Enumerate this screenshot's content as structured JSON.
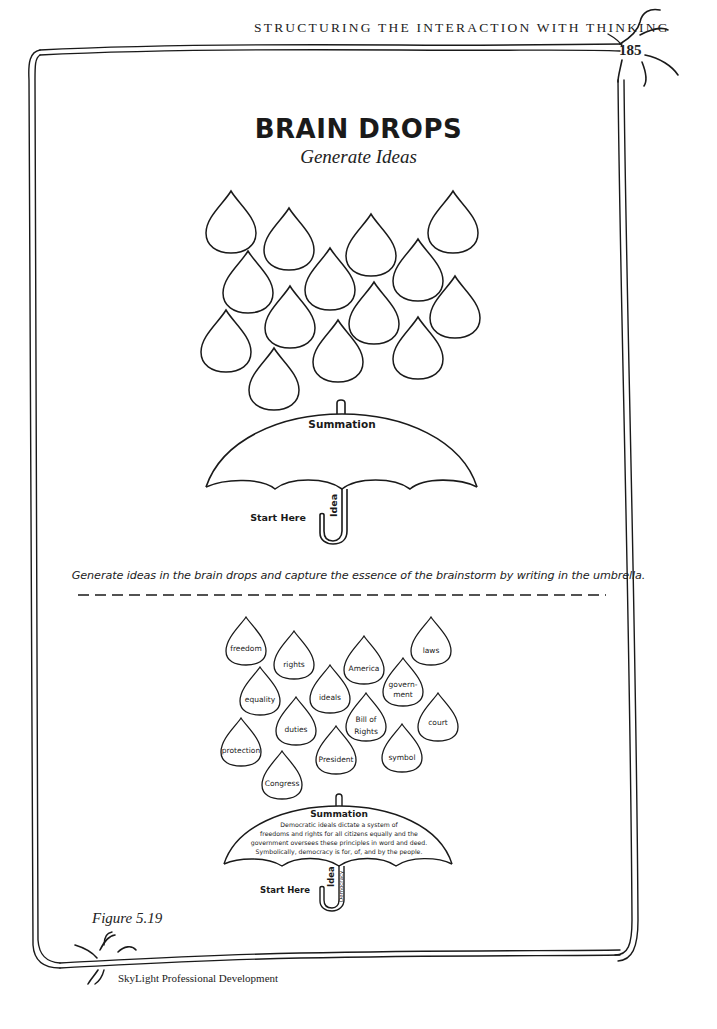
{
  "header": {
    "running_head": "STRUCTURING THE INTERACTION WITH THINKING",
    "page_number": "185"
  },
  "title": "BRAIN DROPS",
  "subtitle": "Generate Ideas",
  "blank_organizer": {
    "drop_count": 14,
    "umbrella": {
      "summation_label": "Summation",
      "idea_label": "Idea",
      "start_label": "Start Here"
    }
  },
  "instruction": "Generate ideas in the brain drops and capture the essence of the brainstorm by writing in the umbrella.",
  "example_organizer": {
    "drops": [
      "freedom",
      "rights",
      "America",
      "laws",
      "equality",
      "ideals",
      "govern-\nment",
      "Bill of\nRights",
      "court",
      "duties",
      "protection",
      "President",
      "symbol",
      "Congress"
    ],
    "umbrella": {
      "summation_label": "Summation",
      "summation_text": [
        "Democratic ideals dictate a system of",
        "freedoms and rights for all citizens equally and the",
        "government oversees these principles in word and deed.",
        "Symbolically, democracy is for, of, and by the people."
      ],
      "idea_label": "Idea",
      "idea_value": "Democracy",
      "start_label": "Start Here"
    }
  },
  "figure_caption": "Figure 5.19",
  "footer": "SkyLight Professional Development",
  "colors": {
    "ink": "#1a1a1a",
    "paper": "#ffffff"
  }
}
